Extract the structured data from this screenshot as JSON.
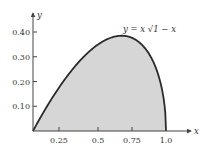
{
  "chart_data": {
    "type": "area",
    "title": "",
    "function": "y = x * sqrt(1 - x)",
    "annotation": "y = x √1 − x",
    "xlabel": "x",
    "ylabel": "y",
    "xlim": [
      0,
      1.0
    ],
    "ylim": [
      0,
      0.4
    ],
    "x_ticks": [
      0.25,
      0.5,
      0.75,
      1.0
    ],
    "x_tick_labels": [
      "0.25",
      "0.5",
      "0.75",
      "1.0"
    ],
    "y_ticks": [
      0.1,
      0.2,
      0.3,
      0.4
    ],
    "y_tick_labels": [
      "0.10",
      "0.20",
      "0.30",
      "0.40"
    ],
    "grid": false,
    "legend": null,
    "x": [
      0,
      0.1,
      0.2,
      0.3,
      0.4,
      0.5,
      0.6,
      0.667,
      0.7,
      0.8,
      0.9,
      0.95,
      1.0
    ],
    "y": [
      0,
      0.095,
      0.179,
      0.251,
      0.31,
      0.354,
      0.379,
      0.385,
      0.383,
      0.358,
      0.285,
      0.212,
      0
    ],
    "shaded_region": "area under curve from x=0 to x=1",
    "colors": {
      "fill": "#d6d6d6",
      "curve": "#2b2b2b",
      "axis": "#444444"
    }
  }
}
